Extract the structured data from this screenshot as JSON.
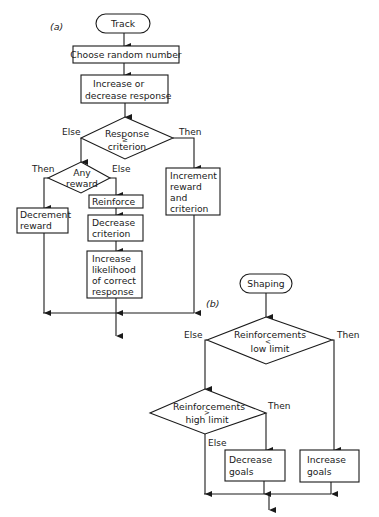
{
  "panel_a": {
    "label": "(a)",
    "start": "Track",
    "step1": "Choose random number",
    "step2": [
      "Increase or",
      "decrease response"
    ],
    "decision1": {
      "line1": "Response",
      "symbol": "≥",
      "line2": "criterion",
      "else_label": "Else",
      "then_label": "Then"
    },
    "decision2": {
      "line1": "Any",
      "line2": "reward",
      "then_label": "Then",
      "else_label": "Else"
    },
    "decrement": [
      "Decrement",
      "reward"
    ],
    "reinforce": "Reinforce",
    "decrease_criterion": [
      "Decrease",
      "criterion"
    ],
    "increase_likelihood": [
      "Increase",
      "likelihood",
      "of correct",
      "response"
    ],
    "increment": [
      "Increment",
      "reward",
      "and",
      "criterion"
    ]
  },
  "panel_b": {
    "label": "(b)",
    "start": "Shaping",
    "decision1": {
      "line1": "Reinforcements",
      "symbol": "<",
      "line2": "low limit",
      "else_label": "Else",
      "then_label": "Then"
    },
    "decision2": {
      "line1": "Reinforcements",
      "symbol": ">",
      "line2": "high limit",
      "then_label": "Then",
      "else_label": "Else"
    },
    "decrease_goals": [
      "Decrease",
      "goals"
    ],
    "increase_goals": [
      "Increase",
      "goals"
    ]
  },
  "colors": {
    "ink": "#1a1a1a",
    "background": "#ffffff"
  }
}
